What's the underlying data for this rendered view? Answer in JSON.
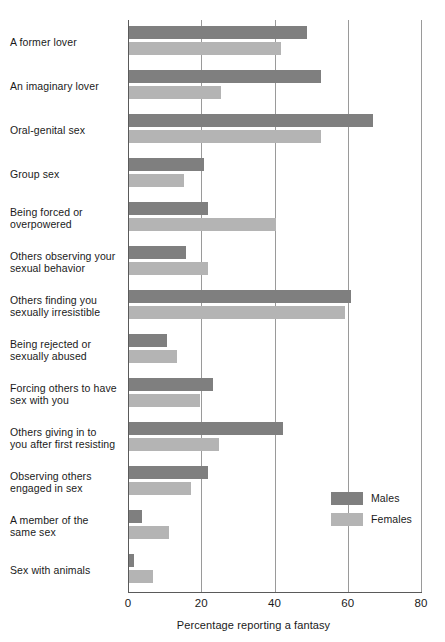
{
  "chart_data": {
    "type": "bar",
    "orientation": "horizontal",
    "title": "",
    "xlabel": "Percentage reporting a fantasy",
    "ylabel": "",
    "xlim": [
      0,
      80
    ],
    "xticks": [
      0,
      20,
      40,
      60,
      80
    ],
    "xtick_labels": [
      "0",
      "20",
      "40",
      "60",
      "80"
    ],
    "grid": true,
    "grid_axis": "x",
    "legend_position": "right-lower",
    "categories": [
      "A former lover",
      "An imaginary lover",
      "Oral-genital sex",
      "Group sex",
      "Being forced or overpowered",
      "Others observing your sexual behavior",
      "Others finding you sexually irresistible",
      "Being rejected or sexually abused",
      "Forcing others to have sex with you",
      "Others giving in to you after first resisting",
      "Observing others engaged in sex",
      "A member of the same sex",
      "Sex with animals"
    ],
    "category_lines": [
      [
        "A former lover"
      ],
      [
        "An imaginary lover"
      ],
      [
        "Oral-genital sex"
      ],
      [
        "Group sex"
      ],
      [
        "Being forced or",
        "overpowered"
      ],
      [
        "Others observing your",
        "sexual behavior"
      ],
      [
        "Others finding you",
        "sexually irresistible"
      ],
      [
        "Being rejected or",
        "sexually abused"
      ],
      [
        "Forcing others to have",
        "sex with you"
      ],
      [
        "Others giving in to",
        "you after first resisting"
      ],
      [
        "Observing others",
        "engaged in sex"
      ],
      [
        "A member of the",
        "same sex"
      ],
      [
        "Sex with animals"
      ]
    ],
    "series": [
      {
        "name": "Males",
        "color": "#7f7f7f",
        "values": [
          48.5,
          52.5,
          66.5,
          20.5,
          21.5,
          15.5,
          60.5,
          10.5,
          23,
          42,
          21.5,
          3.5,
          1.5
        ]
      },
      {
        "name": "Females",
        "color": "#b4b4b4",
        "values": [
          41.5,
          25,
          52.5,
          15,
          40,
          21.5,
          59,
          13,
          19.5,
          24.5,
          17,
          11,
          6.5
        ]
      }
    ]
  },
  "legend": {
    "items": [
      {
        "label": "Males",
        "color": "#7f7f7f"
      },
      {
        "label": "Females",
        "color": "#b4b4b4"
      }
    ]
  }
}
